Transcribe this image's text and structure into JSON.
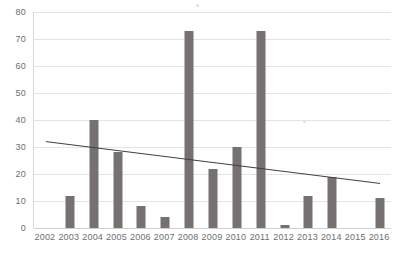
{
  "chart_data": {
    "type": "bar",
    "title": "",
    "subtitle": "",
    "xlabel": "",
    "ylabel": "",
    "categories": [
      "2002",
      "2003",
      "2004",
      "2005",
      "2006",
      "2007",
      "2008",
      "2009",
      "2010",
      "2011",
      "2012",
      "2013",
      "2014",
      "2015",
      "2016"
    ],
    "values": [
      0,
      12,
      40,
      28,
      8,
      4,
      73,
      22,
      30,
      73,
      1,
      12,
      19,
      0,
      11
    ],
    "series": [
      {
        "name": "Count",
        "type": "bar",
        "color": "#767171",
        "values": [
          0,
          12,
          40,
          28,
          8,
          4,
          73,
          22,
          30,
          73,
          1,
          12,
          19,
          0,
          11
        ]
      },
      {
        "name": "Linear trendline",
        "type": "line",
        "color": "#3f3f3f",
        "endpoints": [
          {
            "x": "2002",
            "y": 32.0
          },
          {
            "x": "2016",
            "y": 16.5
          }
        ]
      }
    ],
    "ylim": [
      0,
      80
    ],
    "ytick_step": 10,
    "yticks": [
      "80",
      "70",
      "60",
      "50",
      "40",
      "30",
      "20",
      "10",
      "0"
    ],
    "xticks": [
      "2002",
      "2003",
      "2004",
      "2005",
      "2006",
      "2007",
      "2008",
      "2009",
      "2010",
      "2011",
      "2012",
      "2013",
      "2014",
      "2015",
      "2016"
    ],
    "grid": true,
    "grid_axis": "y",
    "legend": false,
    "legend_position": "none",
    "annotations": []
  },
  "colors": {
    "bar": "#767171",
    "trendline": "#3f3f3f",
    "gridline": "#e4e4e4",
    "axis": "#d0d0d0",
    "tick_label": "#6e6e6e",
    "background": "#ffffff"
  }
}
